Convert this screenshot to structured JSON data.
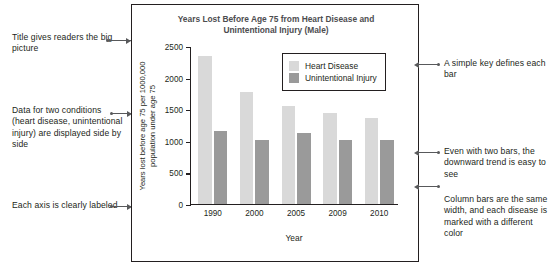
{
  "chart_data": {
    "type": "bar",
    "title": "Years Lost Before Age 75 from Heart Disease and Unintentional Injury (Male)",
    "title_line1": "Years Lost Before Age 75 from Heart Disease and",
    "title_line2": "Unintentional Injury (Male)",
    "xlabel": "Year",
    "ylabel": "Years lost before age 75 per 1000,000 population under age 75",
    "ylabel_line1": "Years lost before age 75 per 1000,000",
    "ylabel_line2": "population under age 75",
    "categories": [
      "1990",
      "2000",
      "2005",
      "2009",
      "2010"
    ],
    "ylim": [
      0,
      2500
    ],
    "yticks": [
      0,
      500,
      1000,
      1500,
      2000,
      2500
    ],
    "ytick_labels": [
      "0",
      "500",
      "1000",
      "1500",
      "2000",
      "2500"
    ],
    "grid": false,
    "legend_position": "top-right-inside",
    "series": [
      {
        "name": "Heart Disease",
        "color": "#d9d9d9",
        "values": [
          2340,
          1760,
          1550,
          1440,
          1360
        ]
      },
      {
        "name": "Unintentional Injury",
        "color": "#9a9a9a",
        "values": [
          1150,
          1010,
          1120,
          1010,
          1010
        ]
      }
    ]
  },
  "legend": {
    "items": [
      {
        "label": "Heart Disease",
        "color": "#d9d9d9"
      },
      {
        "label": "Unintentional Injury",
        "color": "#9a9a9a"
      }
    ]
  },
  "annotations": {
    "left": [
      {
        "id": "title-note",
        "text": "Title gives readers the big picture"
      },
      {
        "id": "series-note",
        "text": "Data for two conditions (heart disease, unintentional injury) are displayed side by side"
      },
      {
        "id": "axis-note",
        "text": "Each axis is clearly labeled"
      }
    ],
    "right": [
      {
        "id": "legend-note",
        "text": "A simple key defines each bar"
      },
      {
        "id": "trend-note",
        "text": "Even with two bars, the downward trend is easy to see"
      },
      {
        "id": "bar-note",
        "text": "Column bars are the same width, and each disease is marked with a different color"
      }
    ]
  },
  "colors": {
    "heart_disease": "#d9d9d9",
    "unintentional_injury": "#9a9a9a",
    "frame": "#231f20",
    "leader": "#58595b",
    "title_text": "#4d4d4f"
  }
}
